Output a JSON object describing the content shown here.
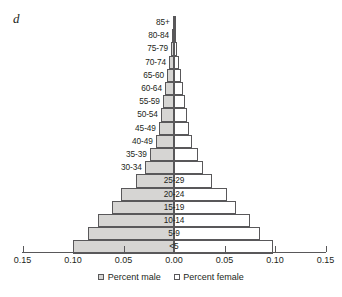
{
  "panel": {
    "letter": "d"
  },
  "legend": {
    "male_label": "Percent male",
    "female_label": "Percent female"
  },
  "axis": {
    "tick_labels": [
      "0.15",
      "0.10",
      "0.05",
      "0.00",
      "0.05",
      "0.10",
      "0.15"
    ],
    "tick_values": [
      -0.15,
      -0.1,
      -0.05,
      0.0,
      0.05,
      0.1,
      0.15
    ]
  },
  "colors": {
    "male_fill": "#d6d5d3",
    "female_fill": "#ffffff",
    "outline": "#59585a",
    "text": "#231f20",
    "background": "#ffffff"
  },
  "chart_data": {
    "type": "bar",
    "subtype": "population-pyramid",
    "title": "",
    "xlabel": "",
    "ylabel": "",
    "xlim": [
      -0.15,
      0.15
    ],
    "grid": false,
    "legend_position": "bottom",
    "orientation": "horizontal",
    "categories": [
      "85+",
      "80-84",
      "75-79",
      "70-74",
      "65-60",
      "60-64",
      "55-59",
      "50-54",
      "45-49",
      "40-49",
      "35-39",
      "30-34",
      "25-29",
      "20-24",
      "15-19",
      "10-14",
      "5-9",
      "<5"
    ],
    "series": [
      {
        "name": "Percent male",
        "values": [
          0.001,
          0.002,
          0.003,
          0.005,
          0.007,
          0.009,
          0.011,
          0.013,
          0.015,
          0.018,
          0.024,
          0.029,
          0.038,
          0.052,
          0.061,
          0.075,
          0.085,
          0.1
        ]
      },
      {
        "name": "Percent female",
        "values": [
          0.001,
          0.002,
          0.003,
          0.005,
          0.007,
          0.009,
          0.011,
          0.013,
          0.015,
          0.018,
          0.024,
          0.029,
          0.038,
          0.052,
          0.061,
          0.075,
          0.085,
          0.098
        ]
      }
    ],
    "label_inside_bar": [
      "25-29",
      "20-24",
      "15-19",
      "10-14",
      "5-9",
      "<5"
    ]
  }
}
